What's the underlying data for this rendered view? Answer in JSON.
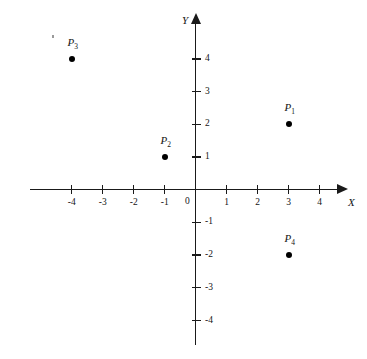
{
  "figure": {
    "kind": "cartesian-coordinate-plane",
    "background_color": "#ffffff",
    "ink_color": "#141414"
  },
  "axes": {
    "x_label": "X",
    "y_label": "Y",
    "origin_label": "0",
    "x_ticks": [
      {
        "value": -4,
        "label": "-4"
      },
      {
        "value": -3,
        "label": "-3"
      },
      {
        "value": -2,
        "label": "-2"
      },
      {
        "value": -1,
        "label": "-1"
      },
      {
        "value": 1,
        "label": "1"
      },
      {
        "value": 2,
        "label": "2"
      },
      {
        "value": 3,
        "label": "3"
      },
      {
        "value": 4,
        "label": "4"
      }
    ],
    "y_ticks": [
      {
        "value": 4,
        "label": "4"
      },
      {
        "value": 3,
        "label": "3"
      },
      {
        "value": 2,
        "label": "2"
      },
      {
        "value": 1,
        "label": "1"
      },
      {
        "value": -1,
        "label": "-1"
      },
      {
        "value": -2,
        "label": "-2"
      },
      {
        "value": -3,
        "label": "-3"
      },
      {
        "value": -4,
        "label": "-4"
      }
    ]
  },
  "chart_data": {
    "type": "scatter",
    "title": "",
    "xlabel": "X",
    "ylabel": "Y",
    "xlim": [
      -5.3,
      4.6
    ],
    "ylim": [
      -4.8,
      5.1
    ],
    "grid": false,
    "legend": "none",
    "categories": [
      "P1",
      "P2",
      "P3",
      "P4"
    ],
    "points": [
      {
        "name": "P1",
        "label_main": "P",
        "label_sub": "1",
        "x": 3,
        "y": 2
      },
      {
        "name": "P2",
        "label_main": "P",
        "label_sub": "2",
        "x": -1,
        "y": 1
      },
      {
        "name": "P3",
        "label_main": "P",
        "label_sub": "3",
        "x": -4,
        "y": 4
      },
      {
        "name": "P4",
        "label_main": "P",
        "label_sub": "4",
        "x": 3,
        "y": -2
      }
    ]
  }
}
